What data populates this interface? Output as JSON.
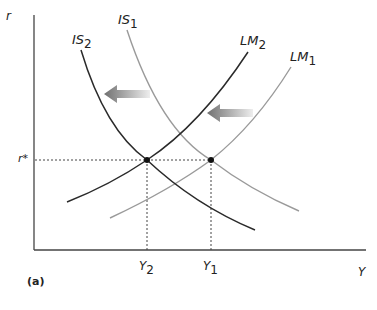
{
  "diagram": {
    "panel_label": "(a)",
    "axes": {
      "y_label": "r",
      "x_label": "Y"
    },
    "curves": [
      {
        "id": "IS2",
        "label": "IS",
        "subscript": "2",
        "color": "#2a2a2a"
      },
      {
        "id": "IS1",
        "label": "IS",
        "subscript": "1",
        "color": "#9a9a9a"
      },
      {
        "id": "LM2",
        "label": "LM",
        "subscript": "2",
        "color": "#2a2a2a"
      },
      {
        "id": "LM1",
        "label": "LM",
        "subscript": "1",
        "color": "#9a9a9a"
      }
    ],
    "equilibrium": {
      "r_label": "r*",
      "y_labels": [
        {
          "label": "Y",
          "subscript": "2"
        },
        {
          "label": "Y",
          "subscript": "1"
        }
      ]
    },
    "shift_arrows": [
      {
        "direction": "left",
        "meaning": "IS shifts from IS1 to IS2"
      },
      {
        "direction": "left",
        "meaning": "LM shifts from LM1 to LM2"
      }
    ],
    "colors": {
      "new_curve": "#2a2a2a",
      "old_curve": "#9a9a9a",
      "axis": "#444444",
      "arrow_dark": "#777777",
      "arrow_light": "#e6e6e6"
    }
  }
}
